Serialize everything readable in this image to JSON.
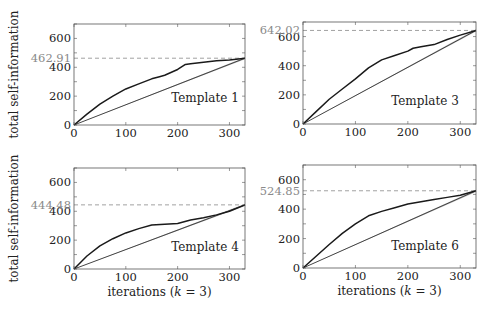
{
  "figure": {
    "ylabel": "total self-information",
    "xlabel": "iterations (k = 3)",
    "xlabel_parts": {
      "pre": "iterations (",
      "var": "k",
      "post": " = 3)"
    },
    "xticks": [
      0,
      100,
      200,
      300
    ],
    "yticks": [
      0,
      200,
      400,
      600
    ],
    "colors": {
      "frame": "#555555",
      "curve": "#1a1a1a",
      "baseline": "#333333",
      "band": "#bdbdbd",
      "dashed": "#8a8a8a",
      "ref_label": "#8a8a8a",
      "text": "#222222"
    }
  },
  "chart_data": [
    {
      "type": "line",
      "title": "Template 1",
      "xlabel": "",
      "ylabel": "total self-information",
      "xlim": [
        0,
        330
      ],
      "ylim": [
        0,
        700
      ],
      "reference_line": {
        "y": 462.91,
        "label": "462.91",
        "style": "dashed"
      },
      "series": [
        {
          "name": "observed",
          "x": [
            0,
            25,
            50,
            75,
            100,
            125,
            150,
            165,
            175,
            200,
            215,
            225,
            250,
            275,
            300,
            330
          ],
          "values": [
            0,
            75,
            145,
            200,
            250,
            285,
            320,
            335,
            345,
            385,
            420,
            425,
            435,
            445,
            450,
            462.91
          ]
        },
        {
          "name": "baseline",
          "x": [
            0,
            330
          ],
          "values": [
            0,
            462.91
          ]
        },
        {
          "name": "baseline-band-upper",
          "x": [
            0,
            330
          ],
          "values": [
            0,
            470
          ]
        },
        {
          "name": "baseline-band-lower",
          "x": [
            0,
            330
          ],
          "values": [
            0,
            455
          ]
        }
      ]
    },
    {
      "type": "line",
      "title": "Template 3",
      "xlabel": "",
      "ylabel": "",
      "xlim": [
        0,
        330
      ],
      "ylim": [
        0,
        700
      ],
      "reference_line": {
        "y": 642.02,
        "label": "642.02",
        "style": "dashed"
      },
      "series": [
        {
          "name": "observed",
          "x": [
            0,
            25,
            50,
            75,
            100,
            125,
            150,
            175,
            200,
            210,
            225,
            250,
            275,
            300,
            330
          ],
          "values": [
            0,
            85,
            170,
            240,
            310,
            385,
            440,
            470,
            500,
            520,
            530,
            545,
            580,
            610,
            642.02
          ]
        },
        {
          "name": "baseline",
          "x": [
            0,
            330
          ],
          "values": [
            0,
            642.02
          ]
        },
        {
          "name": "baseline-band-upper",
          "x": [
            0,
            330
          ],
          "values": [
            0,
            650
          ]
        },
        {
          "name": "baseline-band-lower",
          "x": [
            0,
            330
          ],
          "values": [
            0,
            634
          ]
        }
      ]
    },
    {
      "type": "line",
      "title": "Template 4",
      "xlabel": "iterations (k = 3)",
      "ylabel": "total self-information",
      "xlim": [
        0,
        330
      ],
      "ylim": [
        0,
        700
      ],
      "reference_line": {
        "y": 444.48,
        "label": "444.48",
        "style": "dashed"
      },
      "series": [
        {
          "name": "observed",
          "x": [
            0,
            25,
            50,
            75,
            100,
            125,
            150,
            175,
            200,
            225,
            250,
            275,
            300,
            330
          ],
          "values": [
            0,
            90,
            160,
            210,
            250,
            280,
            305,
            310,
            315,
            340,
            355,
            375,
            400,
            444.48
          ]
        },
        {
          "name": "baseline",
          "x": [
            0,
            330
          ],
          "values": [
            0,
            444.48
          ]
        },
        {
          "name": "baseline-band-upper",
          "x": [
            0,
            330
          ],
          "values": [
            0,
            452
          ]
        },
        {
          "name": "baseline-band-lower",
          "x": [
            0,
            330
          ],
          "values": [
            0,
            437
          ]
        }
      ]
    },
    {
      "type": "line",
      "title": "Template 6",
      "xlabel": "iterations (k = 3)",
      "ylabel": "",
      "xlim": [
        0,
        330
      ],
      "ylim": [
        0,
        700
      ],
      "reference_line": {
        "y": 524.85,
        "label": "524.85",
        "style": "dashed"
      },
      "series": [
        {
          "name": "observed",
          "x": [
            0,
            25,
            50,
            75,
            100,
            125,
            150,
            175,
            200,
            225,
            250,
            275,
            300,
            330
          ],
          "values": [
            0,
            80,
            160,
            235,
            300,
            355,
            385,
            410,
            435,
            450,
            465,
            480,
            495,
            524.85
          ]
        },
        {
          "name": "baseline",
          "x": [
            0,
            330
          ],
          "values": [
            0,
            524.85
          ]
        },
        {
          "name": "baseline-band-upper",
          "x": [
            0,
            330
          ],
          "values": [
            0,
            532
          ]
        },
        {
          "name": "baseline-band-lower",
          "x": [
            0,
            330
          ],
          "values": [
            0,
            517
          ]
        }
      ]
    }
  ],
  "layout": {
    "panels": [
      {
        "left": 74,
        "top": 24,
        "right": 245,
        "bottom": 125,
        "legend_x": 205,
        "legend_y": 102,
        "show_ylabel": true,
        "show_xlabel": false
      },
      {
        "left": 303,
        "top": 22,
        "right": 476,
        "bottom": 124,
        "legend_x": 425,
        "legend_y": 105,
        "show_ylabel": false,
        "show_xlabel": false
      },
      {
        "left": 74,
        "top": 168,
        "right": 245,
        "bottom": 269,
        "legend_x": 205,
        "legend_y": 251,
        "show_ylabel": true,
        "show_xlabel": true
      },
      {
        "left": 303,
        "top": 165,
        "right": 476,
        "bottom": 268,
        "legend_x": 425,
        "legend_y": 250,
        "show_ylabel": false,
        "show_xlabel": true
      }
    ]
  }
}
